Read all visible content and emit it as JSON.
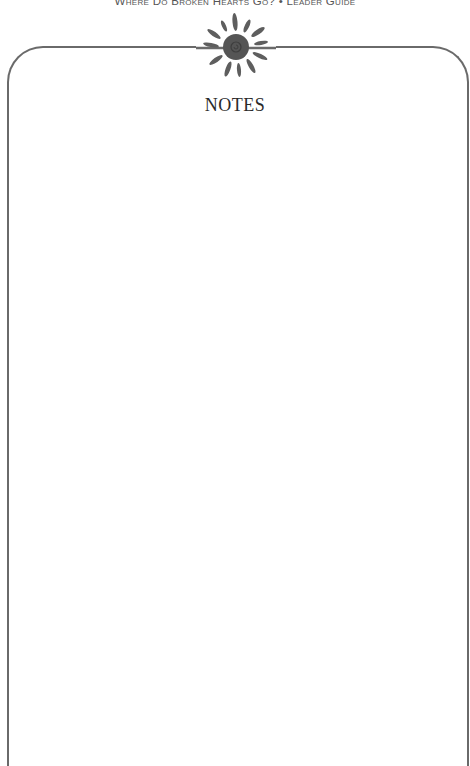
{
  "header": {
    "running_title": "Where Do Broken Hearts Go? • Leader Guide"
  },
  "page": {
    "title": "NOTES",
    "notes_content": ""
  },
  "decoration": {
    "ornament_icon": "sun-icon"
  },
  "colors": {
    "frame": "#6a6a6a",
    "ornament": "#5a5a5a",
    "title_text": "#2a2a2a",
    "header_text": "#555555",
    "background": "#ffffff"
  }
}
